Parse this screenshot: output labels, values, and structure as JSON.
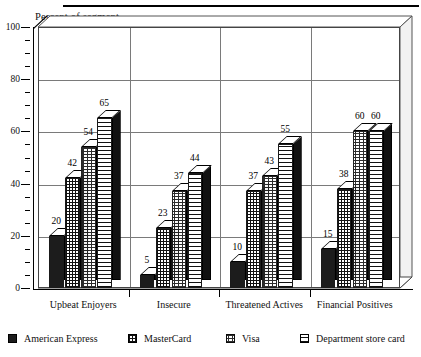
{
  "chart_data": {
    "type": "bar",
    "title": "",
    "xlabel": "",
    "ylabel": "Percent of segment",
    "ylim": [
      0,
      100
    ],
    "ytick_labels": [
      "0",
      "20",
      "40",
      "60",
      "80",
      "100"
    ],
    "ytick_values": [
      0,
      20,
      40,
      60,
      80,
      100
    ],
    "minor_tick_step": 5,
    "grid": "horizontal gridlines every 20 units; vertical separators between category panels",
    "legend_position": "bottom",
    "categories": [
      "Upbeat Enjoyers",
      "Insecure",
      "Threatened Actives",
      "Financial Positives"
    ],
    "series": [
      {
        "name": "American Express",
        "values": [
          20,
          5,
          10,
          15
        ],
        "pattern": "solid-dark"
      },
      {
        "name": "MasterCard",
        "values": [
          42,
          23,
          37,
          38
        ],
        "pattern": "cross-hatch"
      },
      {
        "name": "Visa",
        "values": [
          54,
          37,
          43,
          60
        ],
        "pattern": "stipple-dots"
      },
      {
        "name": "Department store card",
        "values": [
          65,
          44,
          55,
          60
        ],
        "pattern": "horizontal-stripes"
      }
    ],
    "data_labels": [
      [
        "20",
        "42",
        "54",
        "65"
      ],
      [
        "5",
        "23",
        "37",
        "44"
      ],
      [
        "10",
        "37",
        "43",
        "55"
      ],
      [
        "15",
        "38",
        "60",
        "60"
      ]
    ]
  },
  "axis": {
    "y_title": "Percent of segment"
  },
  "legend": {
    "items": [
      {
        "label": "American Express"
      },
      {
        "label": "MasterCard"
      },
      {
        "label": "Visa"
      },
      {
        "label": "Department store card"
      }
    ]
  }
}
